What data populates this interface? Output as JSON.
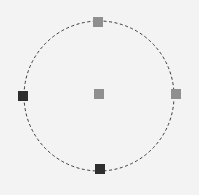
{
  "diagram": {
    "background": "#f3f3f3",
    "circle": {
      "cx": 99,
      "cy": 96,
      "r": 75,
      "stroke": "#3a3a3a",
      "dash": "3,2.5"
    },
    "nodes": [
      {
        "id": "top",
        "x": 98,
        "y": 22,
        "size": 10,
        "color": "#8f8f8f"
      },
      {
        "id": "right",
        "x": 176,
        "y": 94,
        "size": 10,
        "color": "#8f8f8f"
      },
      {
        "id": "center",
        "x": 99,
        "y": 94,
        "size": 10,
        "color": "#8f8f8f"
      },
      {
        "id": "left",
        "x": 23,
        "y": 96,
        "size": 10,
        "color": "#2e2e2e"
      },
      {
        "id": "bottom",
        "x": 100,
        "y": 169,
        "size": 10,
        "color": "#2e2e2e"
      }
    ]
  }
}
